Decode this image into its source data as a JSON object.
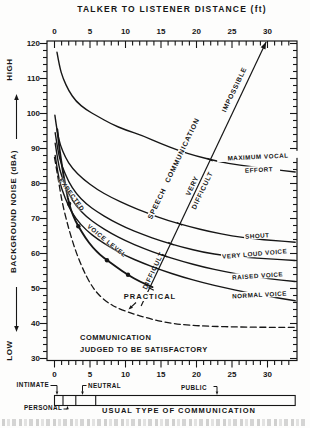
{
  "chart_data": {
    "type": "line",
    "title_top": "TALKER  TO  LISTENER  DISTANCE  (ft)",
    "ylabel": "BACKGROUND  NOISE   (dBA)",
    "ylabel_high": "HIGH",
    "ylabel_low": "LOW",
    "xlim": [
      0,
      34
    ],
    "ylim": [
      30,
      120
    ],
    "x_ticks": [
      0,
      5,
      10,
      15,
      20,
      25,
      30
    ],
    "x_minor_step": 1,
    "y_ticks": [
      120,
      110,
      100,
      90,
      80,
      70,
      60,
      50,
      40,
      30
    ],
    "y_minor_step": 2,
    "series": [
      {
        "name": "maximum-vocal-effort",
        "label": "MAXIMUM VOCAL EFFORT",
        "label_lines": [
          "MAXIMUM  VOCAL",
          "EFFORT"
        ],
        "style": "solid",
        "points": [
          [
            0.35,
            117.5
          ],
          [
            0.7,
            113.5
          ],
          [
            1.2,
            110
          ],
          [
            2,
            106.5
          ],
          [
            3,
            103.5
          ],
          [
            4.5,
            101
          ],
          [
            6,
            99.3
          ],
          [
            8,
            97
          ],
          [
            10,
            95.3
          ],
          [
            12.5,
            93.6
          ],
          [
            15,
            91.4
          ],
          [
            17.5,
            89.4
          ],
          [
            20,
            87.8
          ],
          [
            23,
            86.3
          ],
          [
            26,
            85.2
          ],
          [
            30,
            84.2
          ],
          [
            33.9,
            83.3
          ]
        ]
      },
      {
        "name": "shout",
        "label": "SHOUT",
        "style": "solid",
        "points": [
          [
            0.05,
            99.5
          ],
          [
            0.4,
            94.5
          ],
          [
            0.8,
            91
          ],
          [
            1.5,
            87.5
          ],
          [
            2.5,
            84.3
          ],
          [
            4,
            81.3
          ],
          [
            6,
            78.3
          ],
          [
            8,
            76
          ],
          [
            10.5,
            73.6
          ],
          [
            13,
            71.6
          ],
          [
            16,
            69.4
          ],
          [
            19,
            67.7
          ],
          [
            22,
            66.2
          ],
          [
            25,
            65
          ],
          [
            28,
            64.2
          ],
          [
            31,
            63.7
          ],
          [
            33.9,
            63.2
          ]
        ]
      },
      {
        "name": "very-loud-voice",
        "label": "VERY LOUD VOICE",
        "style": "solid",
        "points": [
          [
            0.1,
            94.5
          ],
          [
            0.5,
            89
          ],
          [
            1,
            85.2
          ],
          [
            2,
            80.4
          ],
          [
            3,
            77.2
          ],
          [
            4.5,
            74.1
          ],
          [
            6,
            71.9
          ],
          [
            8,
            69.5
          ],
          [
            10,
            67.4
          ],
          [
            12.5,
            65.4
          ],
          [
            15,
            63.6
          ],
          [
            18,
            61.8
          ],
          [
            21,
            60.3
          ],
          [
            24,
            59.4
          ],
          [
            27,
            58.9
          ],
          [
            30,
            58.5
          ],
          [
            33.9,
            58
          ]
        ]
      },
      {
        "name": "raised-voice",
        "label": "RAISED VOICE",
        "style": "solid",
        "points": [
          [
            0.1,
            91.5
          ],
          [
            0.5,
            86
          ],
          [
            1,
            82
          ],
          [
            2,
            77
          ],
          [
            3,
            73.7
          ],
          [
            4.5,
            70.5
          ],
          [
            6,
            68.2
          ],
          [
            8,
            65.7
          ],
          [
            10,
            63.6
          ],
          [
            12.5,
            61.5
          ],
          [
            15,
            59.6
          ],
          [
            18,
            57.7
          ],
          [
            21,
            56.1
          ],
          [
            24,
            54.8
          ],
          [
            27,
            53.7
          ],
          [
            30,
            52.8
          ],
          [
            33.9,
            52
          ]
        ]
      },
      {
        "name": "normal-voice",
        "label": "NORMAL VOICE",
        "style": "solid",
        "points": [
          [
            0.1,
            88
          ],
          [
            0.5,
            82.5
          ],
          [
            1,
            78.4
          ],
          [
            2,
            73.3
          ],
          [
            3,
            69.9
          ],
          [
            4.5,
            66.6
          ],
          [
            6,
            64.2
          ],
          [
            8,
            61.6
          ],
          [
            10,
            59.4
          ],
          [
            12.5,
            57.2
          ],
          [
            15,
            55.3
          ],
          [
            18,
            53.3
          ],
          [
            21,
            51.6
          ],
          [
            24,
            50.2
          ],
          [
            27,
            48.9
          ],
          [
            30,
            47.8
          ],
          [
            33.9,
            46.5
          ]
        ]
      },
      {
        "name": "expected-voice-level",
        "label": "EXPECTED VOICE LEVEL",
        "label_parts": [
          "EXPECTED",
          "VOICE  LEVEL"
        ],
        "style": "heavy",
        "points": [
          [
            0.4,
            95.5
          ],
          [
            0.6,
            91.5
          ],
          [
            0.9,
            87
          ],
          [
            1.3,
            82
          ],
          [
            1.7,
            77.7
          ],
          [
            2.05,
            74.2
          ],
          [
            2.6,
            70.8
          ],
          [
            3.35,
            67.8
          ],
          [
            4.3,
            64.6
          ],
          [
            5.4,
            61.7
          ],
          [
            6.4,
            59.6
          ],
          [
            7.4,
            58.1
          ],
          [
            8.8,
            56
          ],
          [
            10.35,
            53.9
          ],
          [
            12,
            52
          ],
          [
            13.8,
            50.4
          ]
        ],
        "dots": [
          [
            2.05,
            74.2
          ],
          [
            3.35,
            67.8
          ],
          [
            7.4,
            58.1
          ],
          [
            10.35,
            53.9
          ]
        ]
      },
      {
        "name": "satisfactory-limit",
        "label": "",
        "style": "dashed",
        "points": [
          [
            0,
            87.5
          ],
          [
            0.3,
            84
          ],
          [
            0.7,
            79
          ],
          [
            1.2,
            73.5
          ],
          [
            2,
            67
          ],
          [
            3,
            60.5
          ],
          [
            4,
            55.5
          ],
          [
            5,
            51.5
          ],
          [
            6,
            48.6
          ],
          [
            7.5,
            45.9
          ],
          [
            9,
            44.3
          ],
          [
            11,
            42.8
          ],
          [
            13,
            41.6
          ],
          [
            15,
            40.6
          ],
          [
            17,
            39.9
          ],
          [
            19,
            39.5
          ],
          [
            22,
            39.2
          ],
          [
            26,
            39
          ],
          [
            30,
            38.9
          ],
          [
            33.9,
            38.9
          ]
        ]
      }
    ],
    "scale_line": {
      "from": [
        12.2,
        45
      ],
      "to": [
        29.8,
        120.4
      ],
      "crossings": [
        [
          13.6,
          49.9
        ],
        [
          14.5,
          55.7
        ],
        [
          15.5,
          59.4
        ],
        [
          16.4,
          62.8
        ],
        [
          17.6,
          68.5
        ],
        [
          21.9,
          86.8
        ]
      ],
      "labels": {
        "axis": "SPEECH COMMUNICATION",
        "practical": "PRACTICAL",
        "difficult": "DIFFICULT",
        "very_difficult": "VERY\nDIFFICULT",
        "impossible": "IMPOSSIBLE"
      }
    },
    "satisfactory_lines": [
      "COMMUNICATION",
      "JUDGED  TO  BE  SATISFACTORY"
    ],
    "communication_bar": {
      "caption": "USUAL  TYPE  OF  COMMUNICATION",
      "segments": [
        {
          "label": "INTIMATE",
          "from_ft": 0,
          "to_ft": 1.2
        },
        {
          "label": "PERSONAL",
          "from_ft": 1.2,
          "to_ft": 3
        },
        {
          "label": "NEUTRAL",
          "from_ft": 3,
          "to_ft": 5.8
        },
        {
          "label": "PUBLIC",
          "from_ft": 5.8,
          "to_ft": 33.9
        }
      ]
    }
  }
}
